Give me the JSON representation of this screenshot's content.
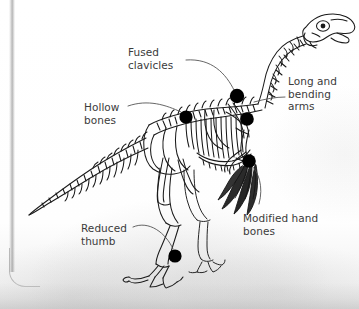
{
  "figure": {
    "subject_name": "dinosaur-skeleton",
    "ink_color": "#1a1a1a",
    "marker_color": "#000000",
    "label_color": "#3b3b3b",
    "leader_color": "#4a4a4a",
    "background_color": "#fdfdfd"
  },
  "labels": [
    {
      "id": "fused-clavicles",
      "text": "Fused\nclavicles",
      "x": 128,
      "y": 46
    },
    {
      "id": "hollow-bones",
      "text": "Hollow\nbones",
      "x": 84,
      "y": 101
    },
    {
      "id": "long-bending-arms",
      "text": "Long and\nbending\narms",
      "x": 288,
      "y": 75
    },
    {
      "id": "modified-hand-bones",
      "text": "Modified hand\nbones",
      "x": 243,
      "y": 212
    },
    {
      "id": "reduced-thumb",
      "text": "Reduced\nthumb",
      "x": 81,
      "y": 222
    }
  ],
  "markers": [
    {
      "id": "marker-clavicle",
      "cx": 237,
      "cy": 96,
      "r": 7.2
    },
    {
      "id": "marker-hollow-bone",
      "cx": 186,
      "cy": 117,
      "r": 6.6
    },
    {
      "id": "marker-arm",
      "cx": 247,
      "cy": 119,
      "r": 6.8
    },
    {
      "id": "marker-hand",
      "cx": 249,
      "cy": 161,
      "r": 6.8
    },
    {
      "id": "marker-thumb",
      "cx": 175,
      "cy": 256,
      "r": 6.6
    }
  ],
  "leaders": [
    {
      "id": "leader-fused-clavicles",
      "path": "M186,60 C212,58 226,74 234,90"
    },
    {
      "id": "leader-hollow-bones",
      "path": "M128,106 C148,99 166,105 181,112"
    },
    {
      "id": "leader-long-bending-arms",
      "path": "M285,97 C276,97 265,99 254,102"
    },
    {
      "id": "leader-modified-hand",
      "path": "M259,204 C264,186 258,172 252,166"
    },
    {
      "id": "leader-reduced-thumb",
      "path": "M133,227 C149,220 166,233 173,249"
    }
  ]
}
